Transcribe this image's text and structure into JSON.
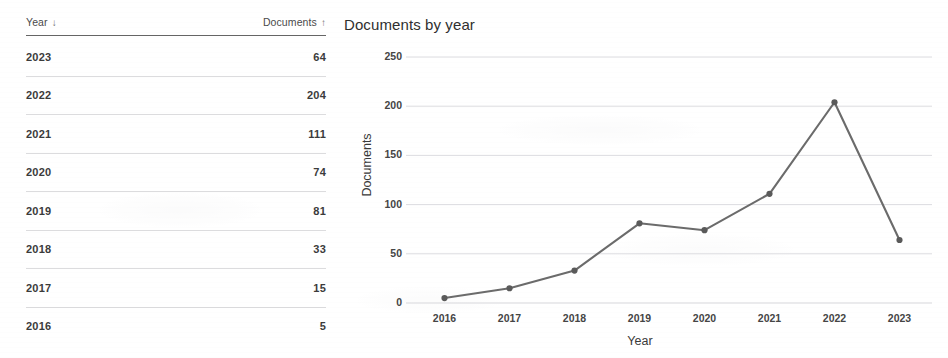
{
  "table": {
    "columns": [
      {
        "label": "Year",
        "sort_icon": "↓",
        "sort_name": "sort-desc-icon"
      },
      {
        "label": "Documents",
        "sort_icon": "↑",
        "sort_name": "sort-asc-icon"
      }
    ],
    "rows": [
      {
        "year": "2023",
        "documents": "64"
      },
      {
        "year": "2022",
        "documents": "204"
      },
      {
        "year": "2021",
        "documents": "111"
      },
      {
        "year": "2020",
        "documents": "74"
      },
      {
        "year": "2019",
        "documents": "81"
      },
      {
        "year": "2018",
        "documents": "33"
      },
      {
        "year": "2017",
        "documents": "15"
      },
      {
        "year": "2016",
        "documents": "5"
      }
    ]
  },
  "chart_data": {
    "type": "line",
    "title": "Documents by year",
    "xlabel": "Year",
    "ylabel": "Documents",
    "categories": [
      "2016",
      "2017",
      "2018",
      "2019",
      "2020",
      "2021",
      "2022",
      "2023"
    ],
    "values": [
      5,
      15,
      33,
      81,
      74,
      111,
      204,
      64
    ],
    "x": [
      2016,
      2017,
      2018,
      2019,
      2020,
      2021,
      2022,
      2023
    ],
    "xlim": [
      2015.6,
      2023.4
    ],
    "ylim": [
      0,
      250
    ],
    "yticks": [
      0,
      50,
      100,
      150,
      200,
      250
    ],
    "xticks": [
      "2016",
      "2017",
      "2018",
      "2019",
      "2020",
      "2021",
      "2022",
      "2023"
    ],
    "grid": true,
    "grid_axis": "y",
    "legend": false,
    "series": [
      {
        "name": "Documents",
        "values": [
          5,
          15,
          33,
          81,
          74,
          111,
          204,
          64
        ]
      }
    ],
    "line_color": "#6b6b6b",
    "marker": "circle",
    "marker_color": "#5a5a5a",
    "grid_color": "#d8d8dc"
  },
  "colors": {
    "text": "#3a3a3a",
    "rule": "#4a4a4a",
    "row_divider": "#8c8c91",
    "background": "#ffffff"
  }
}
